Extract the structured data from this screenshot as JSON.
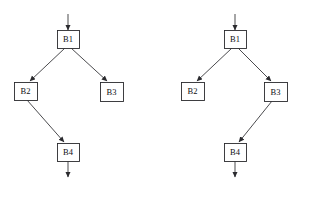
{
  "figure": {
    "heading_clipped": " ",
    "caption_clipped": " ",
    "background_color": "#ffffff",
    "line_color": "#2a2a2e",
    "label_color": "#101014"
  },
  "diagrams": [
    {
      "id": "left-cfg",
      "name": "left-control-flow-graph",
      "nodes": [
        {
          "id": "B1",
          "label": "B1",
          "x": 57,
          "y": 30,
          "w": 22,
          "h": 18
        },
        {
          "id": "B2",
          "label": "B2",
          "x": 14,
          "y": 82,
          "w": 23,
          "h": 18
        },
        {
          "id": "B3",
          "label": "B3",
          "x": 100,
          "y": 82,
          "w": 23,
          "h": 19
        },
        {
          "id": "B4",
          "label": "B4",
          "x": 57,
          "y": 143,
          "w": 22,
          "h": 18
        }
      ],
      "entry_arrow": {
        "x": 68,
        "y1": 14,
        "y2": 30
      },
      "exit_arrow": {
        "x": 68,
        "y1": 161,
        "y2": 177
      },
      "edges": [
        {
          "from": "B1",
          "to": "B2",
          "x1": 65,
          "y1": 48,
          "x2": 30,
          "y2": 81
        },
        {
          "from": "B1",
          "to": "B3",
          "x1": 71,
          "y1": 48,
          "x2": 107,
          "y2": 81
        },
        {
          "from": "B2",
          "to": "B4",
          "x1": 27,
          "y1": 100,
          "x2": 64,
          "y2": 142
        }
      ]
    },
    {
      "id": "right-cfg",
      "name": "right-control-flow-graph",
      "nodes": [
        {
          "id": "B1",
          "label": "B1",
          "x": 224,
          "y": 30,
          "w": 22,
          "h": 18
        },
        {
          "id": "B2",
          "label": "B2",
          "x": 181,
          "y": 82,
          "w": 23,
          "h": 18
        },
        {
          "id": "B3",
          "label": "B3",
          "x": 264,
          "y": 82,
          "w": 23,
          "h": 19
        },
        {
          "id": "B4",
          "label": "B4",
          "x": 224,
          "y": 143,
          "w": 22,
          "h": 18
        }
      ],
      "entry_arrow": {
        "x": 235,
        "y1": 14,
        "y2": 30
      },
      "exit_arrow": {
        "x": 235,
        "y1": 161,
        "y2": 177
      },
      "edges": [
        {
          "from": "B1",
          "to": "B2",
          "x1": 232,
          "y1": 48,
          "x2": 197,
          "y2": 81
        },
        {
          "from": "B1",
          "to": "B3",
          "x1": 238,
          "y1": 48,
          "x2": 271,
          "y2": 81
        },
        {
          "from": "B3",
          "to": "B4",
          "x1": 272,
          "y1": 101,
          "x2": 239,
          "y2": 142
        }
      ]
    }
  ]
}
